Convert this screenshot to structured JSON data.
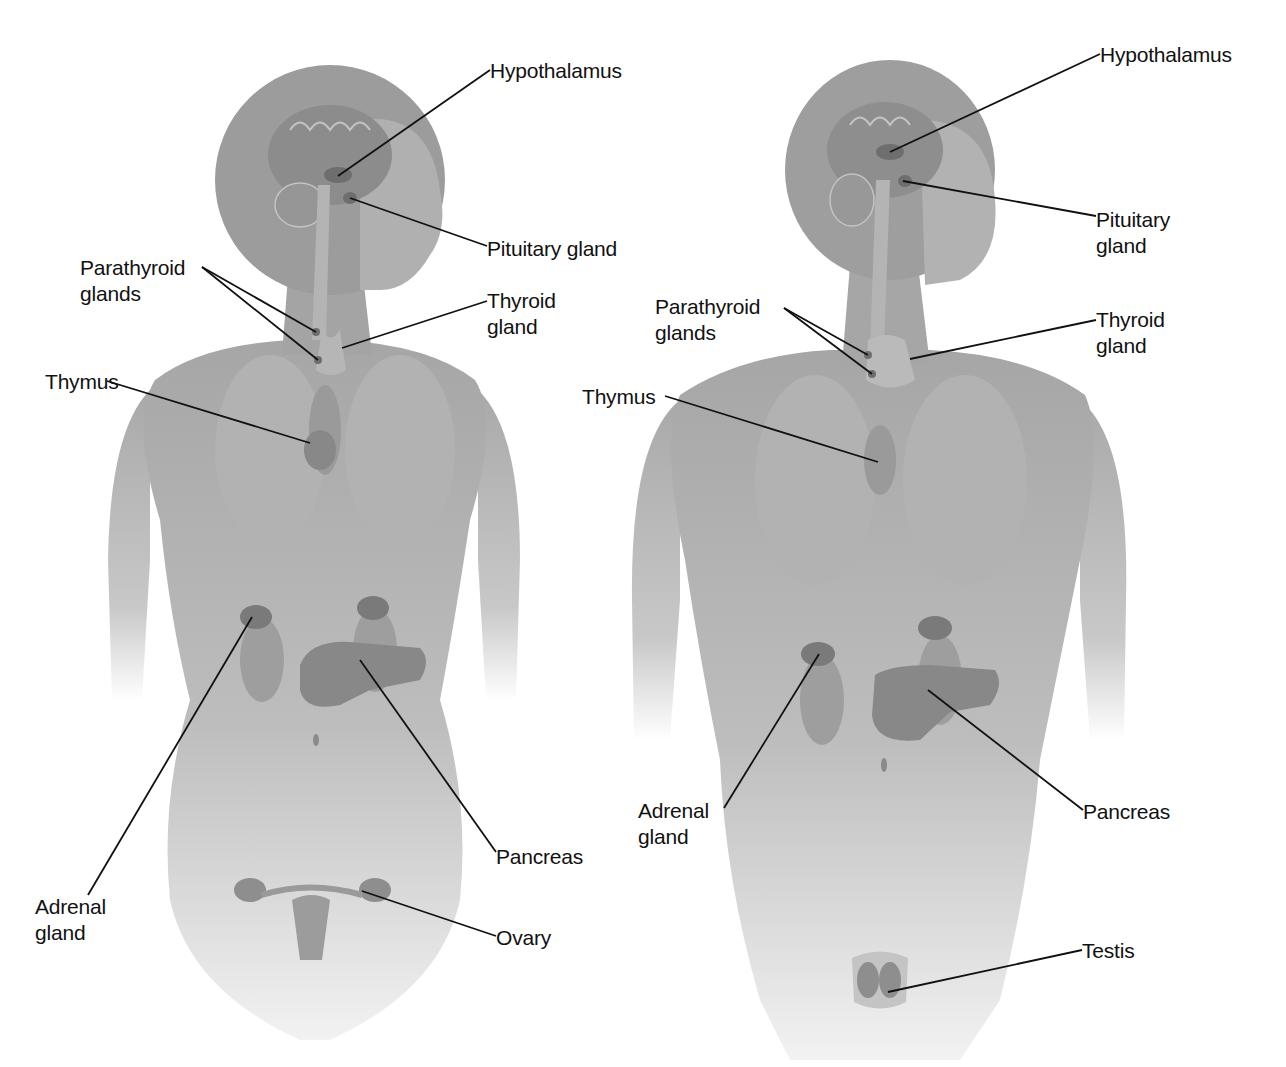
{
  "figure": {
    "colors": {
      "body": "#a8a8a8",
      "body_light": "#d4d4d4",
      "organ": "#8a8a8a",
      "gland": "#6e6e6e",
      "line": "#111111",
      "text": "#111111",
      "background": "#ffffff"
    }
  },
  "female": {
    "labels": [
      {
        "id": "hypothalamus",
        "text": "Hypothalamus",
        "x": 490,
        "y": 58,
        "line": [
          [
            490,
            70
          ],
          [
            338,
            176
          ]
        ]
      },
      {
        "id": "pituitary",
        "text": "Pituitary gland",
        "x": 487,
        "y": 236,
        "line": [
          [
            487,
            246
          ],
          [
            350,
            198
          ]
        ]
      },
      {
        "id": "parathyroid",
        "text": "Parathyroid\nglands",
        "x": 80,
        "y": 255,
        "line": [
          [
            202,
            267
          ],
          [
            316,
            332
          ]
        ],
        "line2": [
          [
            202,
            267
          ],
          [
            318,
            360
          ]
        ]
      },
      {
        "id": "thyroid",
        "text": "Thyroid\ngland",
        "x": 487,
        "y": 288,
        "line": [
          [
            487,
            301
          ],
          [
            342,
            348
          ]
        ]
      },
      {
        "id": "thymus",
        "text": "Thymus",
        "x": 45,
        "y": 369,
        "line": [
          [
            107,
            381
          ],
          [
            310,
            443
          ]
        ]
      },
      {
        "id": "adrenal",
        "text": "Adrenal\ngland",
        "x": 35,
        "y": 894,
        "line": [
          [
            88,
            895
          ],
          [
            252,
            617
          ]
        ]
      },
      {
        "id": "pancreas",
        "text": "Pancreas",
        "x": 496,
        "y": 844,
        "line": [
          [
            496,
            852
          ],
          [
            360,
            660
          ]
        ]
      },
      {
        "id": "ovary",
        "text": "Ovary",
        "x": 496,
        "y": 925,
        "line": [
          [
            496,
            936
          ],
          [
            362,
            891
          ]
        ]
      }
    ]
  },
  "male": {
    "labels": [
      {
        "id": "hypothalamus",
        "text": "Hypothalamus",
        "x": 1100,
        "y": 42,
        "line": [
          [
            1100,
            54
          ],
          [
            890,
            152
          ]
        ]
      },
      {
        "id": "pituitary",
        "text": "Pituitary\ngland",
        "x": 1096,
        "y": 207,
        "line": [
          [
            1096,
            216
          ],
          [
            903,
            181
          ]
        ]
      },
      {
        "id": "parathyroid",
        "text": "Parathyroid\nglands",
        "x": 655,
        "y": 294,
        "line": [
          [
            784,
            308
          ],
          [
            868,
            355
          ]
        ],
        "line2": [
          [
            784,
            308
          ],
          [
            872,
            374
          ]
        ]
      },
      {
        "id": "thyroid",
        "text": "Thyroid\ngland",
        "x": 1096,
        "y": 307,
        "line": [
          [
            1096,
            320
          ],
          [
            910,
            359
          ]
        ]
      },
      {
        "id": "thymus",
        "text": "Thymus",
        "x": 582,
        "y": 384,
        "line": [
          [
            665,
            396
          ],
          [
            878,
            462
          ]
        ]
      },
      {
        "id": "adrenal",
        "text": "Adrenal\ngland",
        "x": 638,
        "y": 798,
        "line": [
          [
            724,
            808
          ],
          [
            819,
            654
          ]
        ]
      },
      {
        "id": "pancreas",
        "text": "Pancreas",
        "x": 1083,
        "y": 799,
        "line": [
          [
            1083,
            810
          ],
          [
            928,
            690
          ]
        ]
      },
      {
        "id": "testis",
        "text": "Testis",
        "x": 1082,
        "y": 938,
        "line": [
          [
            1082,
            950
          ],
          [
            888,
            992
          ]
        ]
      }
    ]
  }
}
